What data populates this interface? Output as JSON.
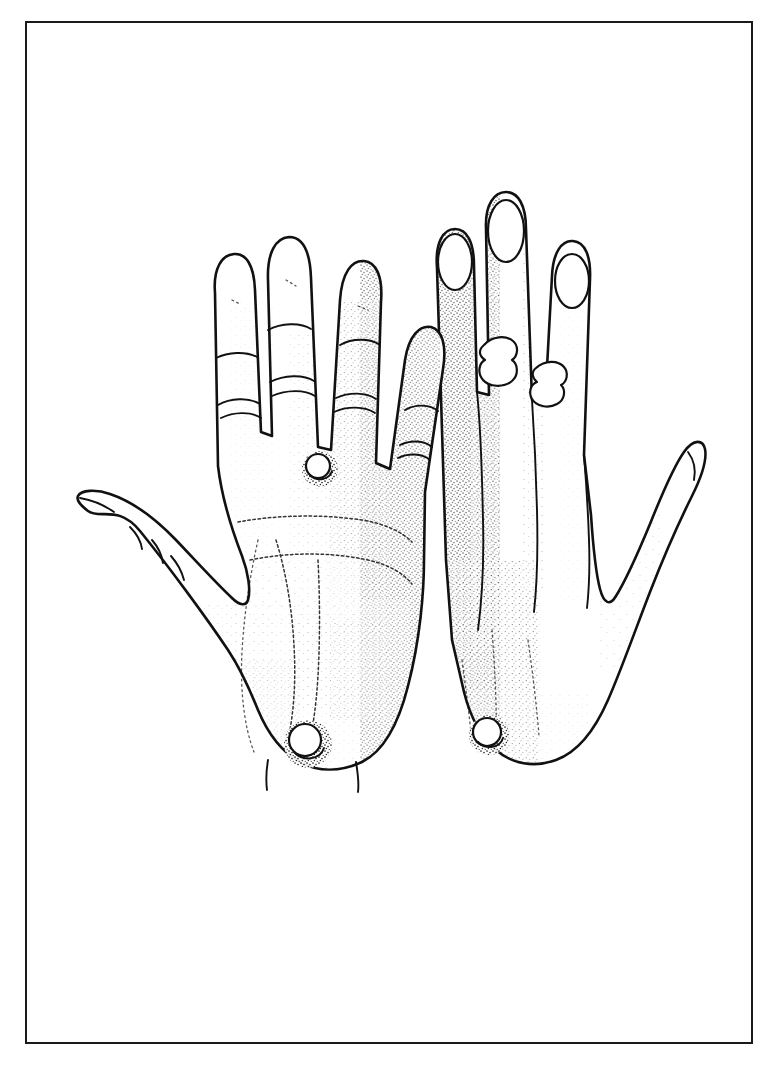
{
  "page": {
    "background_color": "#ffffff",
    "ink_color": "#111111",
    "width": 768,
    "height": 1069
  },
  "plate": {
    "border_color": "#1a1a1a",
    "border_width_px": 2,
    "caption": ""
  },
  "illustration": {
    "title": "",
    "style": "pen-and-ink stipple line drawing",
    "subject": "two human hands",
    "hands": [
      {
        "id": "left-hand",
        "view": "palmar",
        "side": "left",
        "digits": [
          "index",
          "middle",
          "ring",
          "little",
          "thumb"
        ],
        "thumb_direction": "abducted-outward-left",
        "lesions": [
          {
            "name": "interdigital-wart",
            "location": "between-ring-and-little-finger-web",
            "shape": "round"
          },
          {
            "name": "wrist-wart",
            "location": "distal-palm-wrist-junction",
            "shape": "round-annular"
          }
        ]
      },
      {
        "id": "right-hand",
        "view": "dorsal",
        "side": "right",
        "digits": [
          "index",
          "middle",
          "ring",
          "little",
          "thumb"
        ],
        "thumb_direction": "abducted-outward-right",
        "nails_visible": true,
        "lesions": [
          {
            "name": "finger-wart-middle",
            "location": "proximal-interphalangeal-middle-finger",
            "shape": "lobulated"
          },
          {
            "name": "finger-wart-ring",
            "location": "proximal-interphalangeal-ring-finger",
            "shape": "lobulated"
          },
          {
            "name": "dorsum-wart",
            "location": "dorsum-near-wrist",
            "shape": "round-annular"
          }
        ]
      }
    ]
  }
}
